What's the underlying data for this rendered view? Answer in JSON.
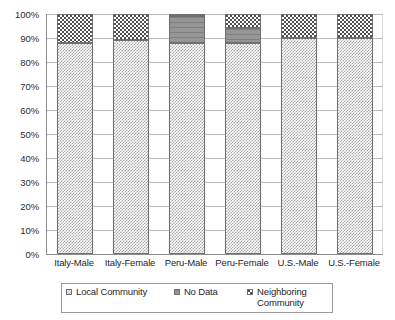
{
  "chart_data": {
    "type": "bar",
    "stacked": true,
    "title": "",
    "xlabel": "",
    "ylabel": "",
    "ylim": [
      0,
      100
    ],
    "grid": true,
    "legend_position": "bottom",
    "categories": [
      "Italy-Male",
      "Italy-Female",
      "Peru-Male",
      "Peru-Female",
      "U.S.-Male",
      "U.S.-Female"
    ],
    "y_tick_labels": [
      "100%",
      "90%",
      "80%",
      "70%",
      "60%",
      "50%",
      "40%",
      "30%",
      "20%",
      "10%",
      "0%"
    ],
    "y_tick_values": [
      100,
      90,
      80,
      70,
      60,
      50,
      40,
      30,
      20,
      10,
      0
    ],
    "series": [
      {
        "name": "Local Community",
        "pattern": "light-checker",
        "color": "#a8a8a8",
        "values": [
          88,
          89,
          88,
          88,
          90,
          90
        ]
      },
      {
        "name": "No Data",
        "pattern": "solid-dark-gray",
        "color": "#8f8f8f",
        "values": [
          0,
          0,
          11,
          6,
          0,
          0
        ]
      },
      {
        "name": "Neighboring Community",
        "pattern": "coarse-speckle",
        "color": "#4f4f4f",
        "values": [
          12,
          11,
          1,
          6,
          10,
          10
        ]
      }
    ]
  },
  "legend": {
    "items": [
      {
        "label": "Local Community"
      },
      {
        "label": "No Data"
      },
      {
        "label": "Neighboring Community"
      }
    ]
  }
}
